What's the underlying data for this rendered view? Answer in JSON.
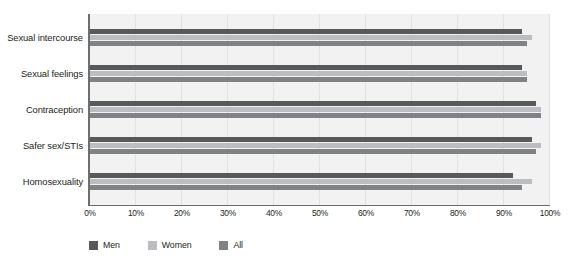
{
  "chart_data": {
    "type": "bar",
    "orientation": "horizontal",
    "title": "",
    "xlabel": "",
    "ylabel": "",
    "xlim": [
      0,
      100
    ],
    "grid": true,
    "legend_position": "bottom-left",
    "categories": [
      "Sexual intercourse",
      "Sexual feelings",
      "Contraception",
      "Safer sex/STIs",
      "Homosexuality"
    ],
    "series": [
      {
        "name": "Men",
        "color": "#58595b",
        "values": [
          94,
          94,
          97,
          96,
          92
        ]
      },
      {
        "name": "Women",
        "color": "#bcbdc0",
        "values": [
          96,
          95,
          98,
          98,
          96
        ]
      },
      {
        "name": "All",
        "color": "#808285",
        "values": [
          95,
          95,
          98,
          97,
          94
        ]
      }
    ],
    "xticks": [
      "0%",
      "10%",
      "20%",
      "30%",
      "40%",
      "50%",
      "60%",
      "70%",
      "80%",
      "90%",
      "100%"
    ],
    "xtick_values": [
      0,
      10,
      20,
      30,
      40,
      50,
      60,
      70,
      80,
      90,
      100
    ]
  },
  "legend": {
    "items": [
      {
        "label": "Men",
        "color": "#58595b"
      },
      {
        "label": "Women",
        "color": "#bcbdc0"
      },
      {
        "label": "All",
        "color": "#808285"
      }
    ]
  }
}
